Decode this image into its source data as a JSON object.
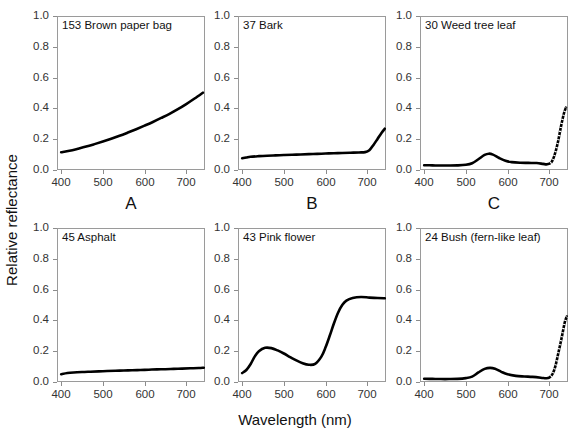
{
  "figure": {
    "axis_label_y": "Relative reflectance",
    "axis_label_x": "Wavelength (nm)",
    "ytick_labels": [
      "1.0",
      "0.8",
      "0.6",
      "0.4",
      "0.2",
      "0.0"
    ],
    "ytick_values": [
      1.0,
      0.8,
      0.6,
      0.4,
      0.2,
      0.0
    ],
    "xtick_labels": [
      "400",
      "500",
      "600",
      "700"
    ],
    "xtick_values": [
      400,
      500,
      600,
      700
    ],
    "curve_color": "#000000",
    "axis_color": "#9a9a9a",
    "text_color": "#111111",
    "panel_letters": [
      "A",
      "B",
      "C"
    ]
  },
  "chart_data": [
    {
      "type": "line",
      "panel": "A",
      "title": "153 Brown paper bag",
      "sample_id": 153,
      "material": "Brown paper bag",
      "xlabel": "Wavelength (nm)",
      "ylabel": "Relative reflectance",
      "xlim": [
        390,
        745
      ],
      "ylim": [
        0.0,
        1.0
      ],
      "grid": false,
      "x": [
        400,
        420,
        440,
        460,
        480,
        500,
        520,
        540,
        560,
        580,
        600,
        620,
        640,
        660,
        680,
        700,
        720,
        740
      ],
      "y": [
        0.115,
        0.125,
        0.138,
        0.152,
        0.168,
        0.185,
        0.203,
        0.222,
        0.243,
        0.265,
        0.288,
        0.312,
        0.338,
        0.365,
        0.395,
        0.428,
        0.464,
        0.502
      ]
    },
    {
      "type": "line",
      "panel": "B",
      "title": "37 Bark",
      "sample_id": 37,
      "material": "Bark",
      "xlabel": "Wavelength (nm)",
      "ylabel": "Relative reflectance",
      "xlim": [
        390,
        745
      ],
      "ylim": [
        0.0,
        1.0
      ],
      "grid": false,
      "x": [
        400,
        410,
        420,
        440,
        460,
        480,
        500,
        520,
        540,
        560,
        580,
        600,
        620,
        640,
        660,
        680,
        695,
        705,
        715,
        725,
        735,
        742
      ],
      "y": [
        0.076,
        0.081,
        0.086,
        0.09,
        0.093,
        0.095,
        0.097,
        0.099,
        0.101,
        0.103,
        0.105,
        0.107,
        0.109,
        0.11,
        0.112,
        0.114,
        0.116,
        0.128,
        0.163,
        0.203,
        0.243,
        0.268
      ]
    },
    {
      "type": "line",
      "panel": "C",
      "title": "30 Weed tree leaf",
      "sample_id": 30,
      "material": "Weed tree leaf",
      "xlabel": "Wavelength (nm)",
      "ylabel": "Relative reflectance",
      "xlim": [
        390,
        745
      ],
      "ylim": [
        0.0,
        1.0
      ],
      "grid": false,
      "x": [
        400,
        420,
        440,
        460,
        480,
        500,
        515,
        530,
        545,
        555,
        565,
        580,
        595,
        610,
        630,
        650,
        670,
        685,
        695,
        705,
        712,
        720,
        728,
        735,
        740
      ],
      "y": [
        0.031,
        0.03,
        0.029,
        0.029,
        0.03,
        0.034,
        0.044,
        0.07,
        0.098,
        0.106,
        0.1,
        0.078,
        0.06,
        0.051,
        0.047,
        0.046,
        0.045,
        0.04,
        0.037,
        0.05,
        0.09,
        0.17,
        0.28,
        0.365,
        0.405
      ]
    },
    {
      "type": "line",
      "panel": "D",
      "title": "45 Asphalt",
      "sample_id": 45,
      "material": "Asphalt",
      "xlabel": "Wavelength (nm)",
      "ylabel": "Relative reflectance",
      "xlim": [
        390,
        745
      ],
      "ylim": [
        0.0,
        1.0
      ],
      "grid": false,
      "x": [
        400,
        415,
        430,
        450,
        470,
        490,
        510,
        530,
        550,
        570,
        590,
        610,
        630,
        650,
        670,
        690,
        710,
        730,
        742
      ],
      "y": [
        0.05,
        0.058,
        0.062,
        0.065,
        0.067,
        0.069,
        0.071,
        0.073,
        0.075,
        0.076,
        0.078,
        0.08,
        0.082,
        0.083,
        0.085,
        0.087,
        0.089,
        0.091,
        0.093
      ]
    },
    {
      "type": "line",
      "panel": "E",
      "title": "43 Pink flower",
      "sample_id": 43,
      "material": "Pink flower",
      "xlabel": "Wavelength (nm)",
      "ylabel": "Relative reflectance",
      "xlim": [
        390,
        745
      ],
      "ylim": [
        0.0,
        1.0
      ],
      "grid": false,
      "x": [
        400,
        410,
        420,
        430,
        440,
        455,
        470,
        485,
        500,
        515,
        530,
        545,
        560,
        575,
        590,
        600,
        610,
        620,
        630,
        640,
        650,
        665,
        685,
        705,
        725,
        742
      ],
      "y": [
        0.058,
        0.078,
        0.115,
        0.165,
        0.2,
        0.222,
        0.22,
        0.205,
        0.185,
        0.162,
        0.14,
        0.122,
        0.112,
        0.118,
        0.165,
        0.225,
        0.3,
        0.38,
        0.45,
        0.5,
        0.528,
        0.545,
        0.552,
        0.548,
        0.545,
        0.544
      ]
    },
    {
      "type": "line",
      "panel": "F",
      "title": "24 Bush (fern-like leaf)",
      "sample_id": 24,
      "material": "Bush (fern-like leaf)",
      "xlabel": "Wavelength (nm)",
      "ylabel": "Relative reflectance",
      "xlim": [
        390,
        745
      ],
      "ylim": [
        0.0,
        1.0
      ],
      "grid": false,
      "x": [
        400,
        420,
        440,
        460,
        480,
        500,
        515,
        530,
        545,
        558,
        570,
        585,
        600,
        620,
        640,
        660,
        680,
        692,
        700,
        708,
        715,
        722,
        730,
        737,
        742
      ],
      "y": [
        0.021,
        0.02,
        0.019,
        0.019,
        0.02,
        0.025,
        0.035,
        0.062,
        0.085,
        0.092,
        0.086,
        0.066,
        0.05,
        0.04,
        0.036,
        0.033,
        0.028,
        0.024,
        0.028,
        0.052,
        0.105,
        0.19,
        0.29,
        0.385,
        0.425
      ]
    }
  ]
}
